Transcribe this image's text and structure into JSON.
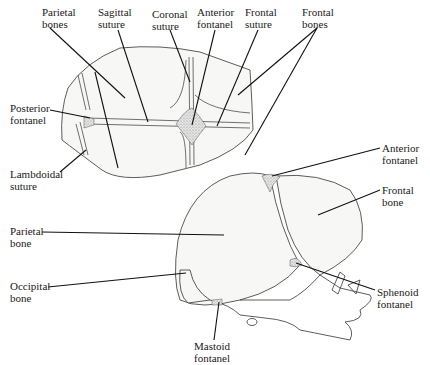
{
  "figure": {
    "views": [
      "superior view",
      "lateral view"
    ]
  },
  "labels": {
    "top_view": {
      "parietal_bones": [
        "Parietal",
        "bones"
      ],
      "sagittal_suture": [
        "Sagittal",
        "suture"
      ],
      "coronal_suture": [
        "Coronal",
        "suture"
      ],
      "anterior_fontanel": [
        "Anterior",
        "fontanel"
      ],
      "frontal_suture": [
        "Frontal",
        "suture"
      ],
      "frontal_bones": [
        "Frontal",
        "bones"
      ],
      "posterior_fontanel": [
        "Posterior",
        "fontanel"
      ],
      "lambdoidal_suture": [
        "Lambdoidal",
        "suture"
      ]
    },
    "side_view": {
      "anterior_fontanel": [
        "Anterior",
        "fontanel"
      ],
      "frontal_bone": [
        "Frontal",
        "bone"
      ],
      "parietal_bone": [
        "Parietal",
        "bone"
      ],
      "occipital_bone": [
        "Occipital",
        "bone"
      ],
      "sphenoid_fontanel": [
        "Sphenoid",
        "fontanel"
      ],
      "mastoid_fontanel": [
        "Mastoid",
        "fontanel"
      ]
    }
  }
}
